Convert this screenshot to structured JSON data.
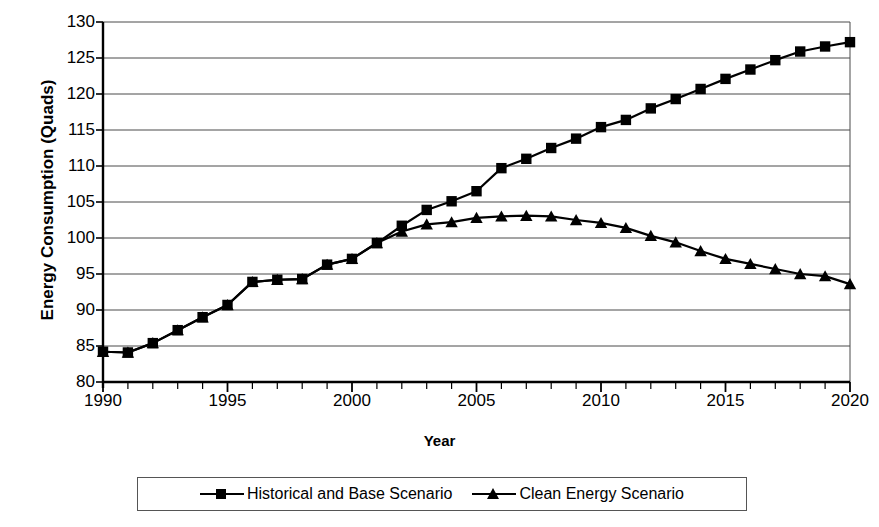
{
  "chart_data": {
    "type": "line",
    "title": "",
    "xlabel": "Year",
    "ylabel": "Energy Consumption (Quads)",
    "xlim": [
      1990,
      2020
    ],
    "ylim": [
      80,
      130
    ],
    "ytick_step": 5,
    "xtick_step": 5,
    "x_minor_tick_step": 1,
    "grid": "horizontal",
    "legend_position": "bottom-outside",
    "yticks": [
      80,
      85,
      90,
      95,
      100,
      105,
      110,
      115,
      120,
      125,
      130
    ],
    "xticks": [
      1990,
      1995,
      2000,
      2005,
      2010,
      2015,
      2020
    ],
    "x": [
      1990,
      1991,
      1992,
      1993,
      1994,
      1995,
      1996,
      1997,
      1998,
      1999,
      2000,
      2001,
      2002,
      2003,
      2004,
      2005,
      2006,
      2007,
      2008,
      2009,
      2010,
      2011,
      2012,
      2013,
      2014,
      2015,
      2016,
      2017,
      2018,
      2019,
      2020
    ],
    "series": [
      {
        "name": "Historical and Base Scenario",
        "marker": "square",
        "color": "#000000",
        "values": [
          84.2,
          84.1,
          85.4,
          87.2,
          89.0,
          90.7,
          93.9,
          94.2,
          94.3,
          96.3,
          97.1,
          99.3,
          101.7,
          103.9,
          105.1,
          106.5,
          109.7,
          111.0,
          112.5,
          113.8,
          115.4,
          116.4,
          118.0,
          119.3,
          120.7,
          122.1,
          123.4,
          124.7,
          125.9,
          126.6,
          127.2
        ]
      },
      {
        "name": "Clean Energy Scenario",
        "marker": "triangle",
        "color": "#000000",
        "values": [
          84.2,
          84.1,
          85.4,
          87.2,
          89.0,
          90.7,
          93.9,
          94.2,
          94.3,
          96.3,
          97.1,
          99.3,
          100.9,
          101.9,
          102.2,
          102.8,
          103.0,
          103.1,
          103.0,
          102.5,
          102.1,
          101.4,
          100.3,
          99.4,
          98.2,
          97.1,
          96.4,
          95.7,
          95.0,
          94.7,
          93.6
        ]
      }
    ]
  },
  "axes": {
    "ylabel": "Energy Consumption (Quads)",
    "xlabel": "Year"
  },
  "legend": {
    "items": [
      {
        "label": "Historical and Base Scenario",
        "marker": "square-marker"
      },
      {
        "label": "Clean Energy Scenario",
        "marker": "triangle-marker"
      }
    ]
  }
}
